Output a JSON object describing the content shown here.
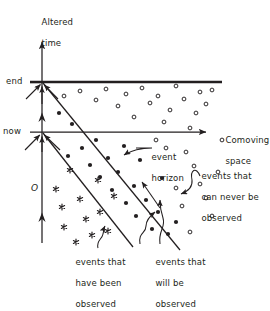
{
  "figure": {
    "title_hidden": "Altered-time vs comoving-space spacetime diagram",
    "axes": {
      "y_axis_label_line1": "Altered",
      "y_axis_label_line2": "time",
      "x_axis_label_line1": "Comoving",
      "x_axis_label_line2": "space",
      "y_tick_end": "end",
      "y_tick_now": "now",
      "origin_label": "O"
    },
    "annotations": [
      {
        "id": "event-horizon",
        "lines": [
          "event",
          "horizon"
        ]
      },
      {
        "id": "never-observed",
        "lines": [
          "events that",
          "can never be",
          "observed"
        ]
      },
      {
        "id": "have-been-observed",
        "lines": [
          "events that",
          "have been",
          "observed"
        ]
      },
      {
        "id": "will-be-observed",
        "lines": [
          "events that",
          "will be",
          "observed"
        ]
      }
    ],
    "colors": {
      "ink": "#231f20",
      "background": "#ffffff"
    }
  },
  "chart_data": {
    "type": "scatter",
    "title": "",
    "xlabel": "Comoving space",
    "ylabel": "Altered time",
    "grid": false,
    "legend": "none",
    "axis_notes": {
      "y_axis_x_px": 42,
      "end_line_y_px": 82,
      "now_line_y_px": 132,
      "y_axis_top_px": 40,
      "y_axis_bottom_px": 243,
      "x_axis_right_px": 212
    },
    "lines": [
      {
        "name": "end-of-time line",
        "style": "thick-horizontal",
        "from": [
          42,
          82
        ],
        "to": [
          222,
          82
        ]
      },
      {
        "name": "now axis (comoving space)",
        "style": "arrowed-horizontal",
        "from": [
          42,
          132
        ],
        "to": [
          212,
          132
        ]
      },
      {
        "name": "altered time axis",
        "style": "arrowed-vertical",
        "from": [
          42,
          243
        ],
        "to": [
          42,
          40
        ]
      },
      {
        "name": "event horizon (past light cone from end)",
        "style": "diagonal",
        "from": [
          42,
          83
        ],
        "to": [
          178,
          248
        ]
      },
      {
        "name": "now light cone",
        "style": "diagonal",
        "from": [
          42,
          133
        ],
        "to": [
          130,
          243
        ]
      }
    ],
    "series": [
      {
        "name": "events that have been observed",
        "marker": "asterisk",
        "points": [
          [
            56,
            189
          ],
          [
            62,
            207
          ],
          [
            64,
            227
          ],
          [
            70,
            170
          ],
          [
            76,
            242
          ],
          [
            80,
            199
          ],
          [
            86,
            219
          ],
          [
            92,
            235
          ],
          [
            98,
            180
          ],
          [
            100,
            212
          ],
          [
            108,
            231
          ],
          [
            114,
            196
          ]
        ]
      },
      {
        "name": "events that will be observed",
        "marker": "filled-circle",
        "points": [
          [
            59,
            113
          ],
          [
            72,
            124
          ],
          [
            68,
            156
          ],
          [
            82,
            148
          ],
          [
            90,
            165
          ],
          [
            96,
            140
          ],
          [
            100,
            177
          ],
          [
            108,
            158
          ],
          [
            112,
            190
          ],
          [
            118,
            172
          ],
          [
            124,
            146
          ],
          [
            126,
            203
          ],
          [
            134,
            186
          ],
          [
            136,
            216
          ],
          [
            140,
            160
          ],
          [
            146,
            200
          ],
          [
            152,
            229
          ],
          [
            158,
            212
          ],
          [
            162,
            178
          ],
          [
            168,
            234
          ],
          [
            176,
            222
          ]
        ]
      },
      {
        "name": "events that can never be observed",
        "marker": "open-circle",
        "points": [
          [
            64,
            96
          ],
          [
            80,
            91
          ],
          [
            96,
            100
          ],
          [
            106,
            89
          ],
          [
            118,
            106
          ],
          [
            126,
            94
          ],
          [
            134,
            117
          ],
          [
            142,
            88
          ],
          [
            150,
            103
          ],
          [
            158,
            96
          ],
          [
            164,
            122
          ],
          [
            170,
            110
          ],
          [
            176,
            86
          ],
          [
            184,
            99
          ],
          [
            190,
            128
          ],
          [
            196,
            113
          ],
          [
            200,
            92
          ],
          [
            206,
            104
          ],
          [
            212,
            90
          ],
          [
            186,
            152
          ],
          [
            194,
            166
          ],
          [
            200,
            184
          ],
          [
            206,
            198
          ],
          [
            212,
            216
          ],
          [
            218,
            172
          ],
          [
            222,
            140
          ],
          [
            176,
            188
          ],
          [
            182,
            206
          ],
          [
            190,
            232
          ],
          [
            156,
            140
          ],
          [
            166,
            148
          ]
        ]
      }
    ],
    "annotation_arrows": [
      {
        "label": "event horizon",
        "points_to": [
          118,
          158
        ]
      },
      {
        "label": "events that can never be observed",
        "points_to": [
          181,
          196
        ]
      },
      {
        "label": "events that have been observed",
        "points_to": [
          107,
          227
        ]
      },
      {
        "label": "events that will be observed",
        "points_to": [
          157,
          211
        ]
      }
    ]
  }
}
